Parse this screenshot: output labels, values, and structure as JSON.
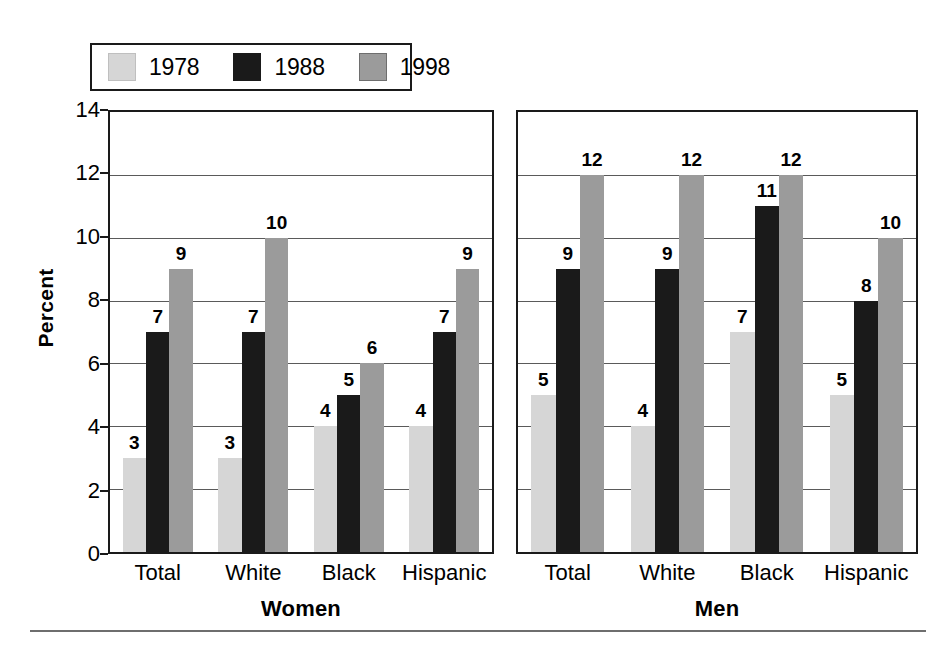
{
  "chart_data": {
    "type": "bar",
    "title": "",
    "xlabel": "",
    "ylabel": "Percent",
    "ylim": [
      0,
      14
    ],
    "ytick_step": 2,
    "yticks": [
      0,
      2,
      4,
      6,
      8,
      10,
      12,
      14
    ],
    "grid": true,
    "legend_position": "top-left",
    "legend": [
      "1978",
      "1988",
      "1998"
    ],
    "categories": [
      "Total",
      "White",
      "Black",
      "Hispanic"
    ],
    "panels": [
      {
        "name": "Women",
        "categories": [
          "Total",
          "White",
          "Black",
          "Hispanic"
        ],
        "series": [
          {
            "name": "1978",
            "values": [
              3,
              3,
              4,
              4
            ]
          },
          {
            "name": "1988",
            "values": [
              7,
              7,
              5,
              7
            ]
          },
          {
            "name": "1998",
            "values": [
              9,
              10,
              6,
              9
            ]
          }
        ]
      },
      {
        "name": "Men",
        "categories": [
          "Total",
          "White",
          "Black",
          "Hispanic"
        ],
        "series": [
          {
            "name": "1978",
            "values": [
              5,
              4,
              7,
              5
            ]
          },
          {
            "name": "1988",
            "values": [
              9,
              9,
              11,
              8
            ]
          },
          {
            "name": "1998",
            "values": [
              12,
              12,
              12,
              10
            ]
          }
        ]
      }
    ],
    "colors": {
      "1978": "#d6d6d6",
      "1988": "#1a1a1a",
      "1998": "#9b9b9b",
      "axis": "#1a1a1a",
      "grid": "#5a5a5a",
      "background": "#ffffff",
      "text": "#000000"
    }
  },
  "legend": {
    "entries": [
      {
        "label": "1978",
        "swatch": "#d6d6d6",
        "border": "#bfbfbf"
      },
      {
        "label": "1988",
        "swatch": "#1a1a1a",
        "border": "#1a1a1a"
      },
      {
        "label": "1998",
        "swatch": "#9b9b9b",
        "border": "#6e6e6e"
      }
    ]
  },
  "axis": {
    "ylabel": "Percent",
    "ticks": [
      "14",
      "12",
      "10",
      "8",
      "6",
      "4",
      "2",
      "0"
    ]
  },
  "panels": {
    "women": {
      "title": "Women",
      "categories": [
        "Total",
        "White",
        "Black",
        "Hispanic"
      ]
    },
    "men": {
      "title": "Men",
      "categories": [
        "Total",
        "White",
        "Black",
        "Hispanic"
      ]
    }
  }
}
